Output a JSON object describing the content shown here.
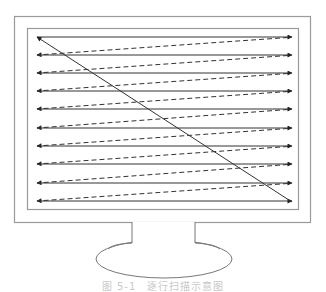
{
  "diagram": {
    "title": "逐行扫描示意图",
    "type": "progressive-scan-raster-diagram",
    "monitor": {
      "outer_frame": {
        "x": 14,
        "y": 16,
        "w": 296,
        "h": 206
      },
      "screen": {
        "x": 27,
        "y": 28,
        "w": 271,
        "h": 181
      },
      "neck": {
        "x1": 132,
        "x2": 195,
        "y_top": 222,
        "y_bottom": 243
      },
      "base": {
        "cx": 164,
        "cy": 259,
        "rx": 68,
        "ry": 19
      }
    },
    "scan": {
      "x_start": 37,
      "x_end": 292,
      "rows_y": [
        37,
        55,
        73,
        91,
        109,
        128,
        146,
        164,
        183,
        201
      ],
      "active_line_style": "solid",
      "retrace_line_style": "dashed",
      "vertical_retrace": "solid diagonal from bottom-right to top-left"
    },
    "colors": {
      "line": "#333333",
      "frame": "#9a9a9a",
      "caption": "#c8c8c8"
    }
  },
  "caption": {
    "text": "图 5-1　逐行扫描示意图"
  }
}
